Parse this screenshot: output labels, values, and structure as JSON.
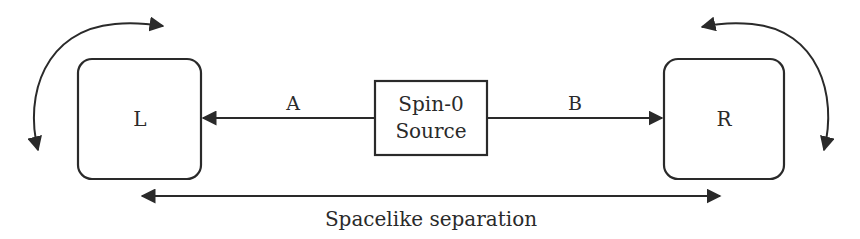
{
  "diagram": {
    "left_box": {
      "label": "L"
    },
    "right_box": {
      "label": "R"
    },
    "source": {
      "line1": "Spin-0",
      "line2": "Source"
    },
    "arrow_a": {
      "label": "A"
    },
    "arrow_b": {
      "label": "B"
    },
    "separation": {
      "label": "Spacelike separation"
    },
    "colors": {
      "stroke": "#2a2a2a",
      "background": "#ffffff"
    }
  }
}
